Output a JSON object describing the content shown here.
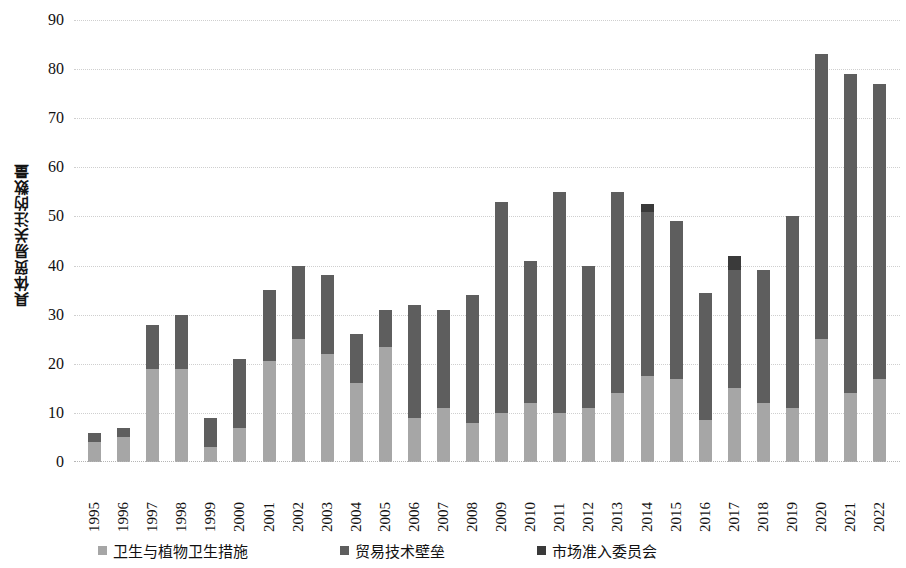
{
  "chart_data": {
    "type": "bar",
    "stacked": true,
    "title": "",
    "xlabel": "",
    "ylabel": "具体贸易关注的数量",
    "ylim": [
      0,
      90
    ],
    "ytick_step": 10,
    "yticks": [
      "90",
      "80",
      "70",
      "60",
      "50",
      "40",
      "30",
      "20",
      "10",
      "0"
    ],
    "grid": true,
    "legend_position": "bottom",
    "categories": [
      "1995",
      "1996",
      "1997",
      "1998",
      "1999",
      "2000",
      "2001",
      "2002",
      "2003",
      "2004",
      "2005",
      "2006",
      "2007",
      "2008",
      "2009",
      "2010",
      "2011",
      "2012",
      "2013",
      "2014",
      "2015",
      "2016",
      "2017",
      "2018",
      "2019",
      "2020",
      "2021",
      "2022"
    ],
    "series": [
      {
        "name": "卫生与植物卫生措施",
        "color": "#a6a6a6",
        "values": [
          4,
          5,
          19,
          19,
          3,
          7,
          20.5,
          25,
          22,
          16,
          23.5,
          9,
          11,
          8,
          10,
          12,
          10,
          11,
          14,
          17.5,
          17,
          8.5,
          15,
          12,
          11,
          25,
          14,
          17
        ]
      },
      {
        "name": "贸易技术壁垒",
        "color": "#5e5e5e",
        "values": [
          2,
          2,
          9,
          11,
          6,
          14,
          14.5,
          15,
          16,
          10,
          7.5,
          23,
          20,
          26,
          43,
          29,
          45,
          29,
          41,
          33.5,
          32,
          26,
          24,
          27,
          39,
          58,
          65,
          60
        ]
      },
      {
        "name": "市场准入委员会",
        "color": "#3a3a3a",
        "values": [
          0,
          0,
          0,
          0,
          0,
          0,
          0,
          0,
          0,
          0,
          0,
          0,
          0,
          0,
          0,
          0,
          0,
          0,
          0,
          1.5,
          0,
          0,
          3,
          0,
          0,
          0,
          0,
          0
        ]
      }
    ],
    "totals": [
      6,
      7,
      28,
      30,
      9,
      21,
      35,
      40,
      38,
      26,
      31,
      32,
      31,
      34,
      53,
      41,
      55,
      40,
      55,
      52.5,
      49,
      34.5,
      42,
      39,
      50,
      83,
      79,
      77
    ]
  }
}
